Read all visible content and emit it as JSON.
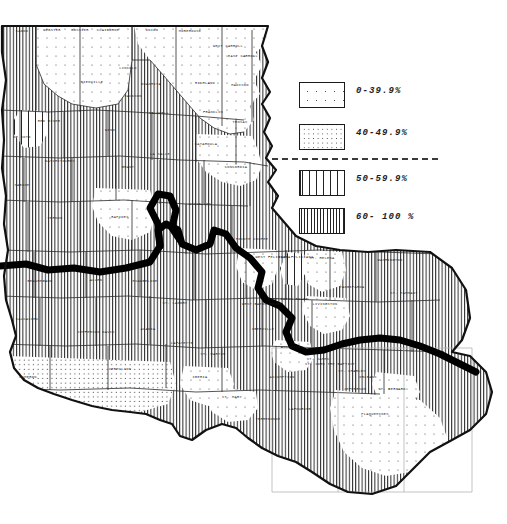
{
  "figure": {
    "type": "choropleth-map",
    "region": "Louisiana",
    "unit": "parish",
    "background_color": "#ffffff",
    "ink_color": "#1b1b1b"
  },
  "legend": {
    "title": "",
    "divider": "dashed",
    "entries": [
      {
        "label": "0-39.9%",
        "pattern": "dots-sparse",
        "class_index": 1,
        "min": 0,
        "max": 39.9
      },
      {
        "label": "40-49.9%",
        "pattern": "dots-dense",
        "class_index": 2,
        "min": 40,
        "max": 49.9
      },
      {
        "label": "50-59.9%",
        "pattern": "lines-wide",
        "class_index": 3,
        "min": 50,
        "max": 59.9
      },
      {
        "label": "60- 100 %",
        "pattern": "lines-narrow",
        "class_index": 4,
        "min": 60,
        "max": 100
      }
    ]
  },
  "map": {
    "heavy_boundary": "thick black dividing line crossing the state",
    "graticule": "faint grid lines over the southeast / delta area",
    "parishes": [
      {
        "name": "CADDO",
        "x": 22,
        "y": 32,
        "class_index": 4
      },
      {
        "name": "WEBSTER",
        "x": 52,
        "y": 31,
        "class_index": 1
      },
      {
        "name": "BOSSIER",
        "x": 80,
        "y": 31,
        "class_index": 4
      },
      {
        "name": "CLAIBORNE",
        "x": 108,
        "y": 31,
        "class_index": 1
      },
      {
        "name": "UNION",
        "x": 152,
        "y": 31,
        "class_index": 1
      },
      {
        "name": "MOREHOUSE",
        "x": 190,
        "y": 32,
        "class_index": 1
      },
      {
        "name": "WEST CARROLL",
        "x": 228,
        "y": 47,
        "class_index": 4
      },
      {
        "name": "EAST CARROLL",
        "x": 243,
        "y": 57,
        "class_index": 1
      },
      {
        "name": "LINCOLN",
        "x": 128,
        "y": 69,
        "class_index": 1
      },
      {
        "name": "BIENVILLE",
        "x": 92,
        "y": 83,
        "class_index": 1
      },
      {
        "name": "JACKSON",
        "x": 133,
        "y": 97,
        "class_index": 1
      },
      {
        "name": "OUACHITA",
        "x": 151,
        "y": 85,
        "class_index": 1
      },
      {
        "name": "RICHLAND",
        "x": 205,
        "y": 84,
        "class_index": 1
      },
      {
        "name": "MADISON",
        "x": 240,
        "y": 86,
        "class_index": 1
      },
      {
        "name": "RED RIVER",
        "x": 49,
        "y": 122,
        "class_index": 4
      },
      {
        "name": "CALDWELL",
        "x": 159,
        "y": 114,
        "class_index": 4
      },
      {
        "name": "FRANKLIN",
        "x": 213,
        "y": 113,
        "class_index": 1
      },
      {
        "name": "TENSAS",
        "x": 240,
        "y": 123,
        "class_index": 1
      },
      {
        "name": "DE SOTO",
        "x": 22,
        "y": 138,
        "class_index": 4
      },
      {
        "name": "WINN",
        "x": 110,
        "y": 131,
        "class_index": 4
      },
      {
        "name": "CATAHOULA",
        "x": 206,
        "y": 145,
        "class_index": 4
      },
      {
        "name": "NATCHITOCHES",
        "x": 60,
        "y": 162,
        "class_index": 4
      },
      {
        "name": "LA SALLE",
        "x": 160,
        "y": 155,
        "class_index": 4
      },
      {
        "name": "GRANT",
        "x": 128,
        "y": 168,
        "class_index": 4
      },
      {
        "name": "CONCORDIA",
        "x": 236,
        "y": 168,
        "class_index": 1
      },
      {
        "name": "SABINE",
        "x": 22,
        "y": 186,
        "class_index": 4
      },
      {
        "name": "RAPIDES",
        "x": 120,
        "y": 218,
        "class_index": 1
      },
      {
        "name": "VERNON",
        "x": 55,
        "y": 219,
        "class_index": 4
      },
      {
        "name": "AVOYELLES",
        "x": 200,
        "y": 205,
        "class_index": 4
      },
      {
        "name": "POINTE COUPEE",
        "x": 252,
        "y": 240,
        "class_index": 4
      },
      {
        "name": "WEST FELICIANA",
        "x": 273,
        "y": 258,
        "class_index": 4
      },
      {
        "name": "EAST FELICIANA",
        "x": 296,
        "y": 258,
        "class_index": 4
      },
      {
        "name": "ST. HELENA",
        "x": 322,
        "y": 259,
        "class_index": 1
      },
      {
        "name": "TANGIPAHOA",
        "x": 352,
        "y": 288,
        "class_index": 4
      },
      {
        "name": "WASHINGTON",
        "x": 390,
        "y": 261,
        "class_index": 4
      },
      {
        "name": "ST. TAMMANY",
        "x": 404,
        "y": 294,
        "class_index": 4
      },
      {
        "name": "BEAUREGARD",
        "x": 40,
        "y": 282,
        "class_index": 4
      },
      {
        "name": "ALLEN",
        "x": 96,
        "y": 281,
        "class_index": 4
      },
      {
        "name": "EVANGELINE",
        "x": 145,
        "y": 282,
        "class_index": 4
      },
      {
        "name": "ST. LANDRY",
        "x": 175,
        "y": 304,
        "class_index": 4
      },
      {
        "name": "WEST BATON ROUGE",
        "x": 262,
        "y": 305,
        "class_index": 1
      },
      {
        "name": "EAST BATON ROUGE",
        "x": 288,
        "y": 300,
        "class_index": 4
      },
      {
        "name": "LIVINGSTON",
        "x": 325,
        "y": 305,
        "class_index": 1
      },
      {
        "name": "CALCASIEU",
        "x": 27,
        "y": 320,
        "class_index": 4
      },
      {
        "name": "JEFFERSON DAVIS",
        "x": 96,
        "y": 333,
        "class_index": 4
      },
      {
        "name": "ACADIA",
        "x": 148,
        "y": 330,
        "class_index": 4
      },
      {
        "name": "LAFAYETTE",
        "x": 182,
        "y": 344,
        "class_index": 4
      },
      {
        "name": "IBERVILLE",
        "x": 263,
        "y": 330,
        "class_index": 4
      },
      {
        "name": "ASCENSION",
        "x": 292,
        "y": 348,
        "class_index": 1
      },
      {
        "name": "ST. JAMES",
        "x": 318,
        "y": 360,
        "class_index": 4
      },
      {
        "name": "ST. JOHN THE BAPTIST",
        "x": 330,
        "y": 365,
        "class_index": 4
      },
      {
        "name": "ST. CHARLES",
        "x": 352,
        "y": 372,
        "class_index": 4
      },
      {
        "name": "CAMERON",
        "x": 28,
        "y": 378,
        "class_index": 2
      },
      {
        "name": "VERMILION",
        "x": 120,
        "y": 370,
        "class_index": 2
      },
      {
        "name": "IBERIA",
        "x": 200,
        "y": 378,
        "class_index": 1
      },
      {
        "name": "ST. MARTIN",
        "x": 213,
        "y": 355,
        "class_index": 4
      },
      {
        "name": "ASSUMPTION",
        "x": 282,
        "y": 378,
        "class_index": 4
      },
      {
        "name": "ST. MARY",
        "x": 232,
        "y": 398,
        "class_index": 1
      },
      {
        "name": "TERREBONNE",
        "x": 268,
        "y": 420,
        "class_index": 4
      },
      {
        "name": "LAFOURCHE",
        "x": 300,
        "y": 410,
        "class_index": 4
      },
      {
        "name": "ORLEANS",
        "x": 368,
        "y": 378,
        "class_index": 4
      },
      {
        "name": "JEFFERSON",
        "x": 355,
        "y": 390,
        "class_index": 4
      },
      {
        "name": "ST. BERNARD",
        "x": 392,
        "y": 390,
        "class_index": 1
      },
      {
        "name": "PLAQUEMINES",
        "x": 375,
        "y": 415,
        "class_index": 1
      }
    ]
  }
}
